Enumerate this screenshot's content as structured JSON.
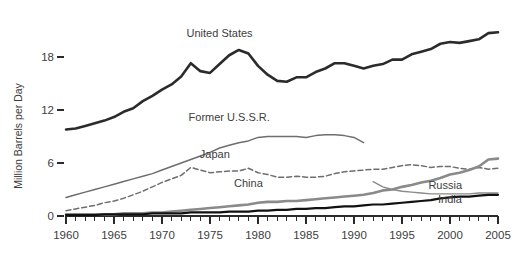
{
  "chart_data": {
    "type": "line",
    "title": "",
    "xlabel": "",
    "ylabel": "Million Barrels per Day",
    "xlim": [
      1960,
      2005
    ],
    "ylim": [
      0,
      20.8
    ],
    "yticks": [
      0,
      6,
      12,
      18
    ],
    "ytick_labels": [
      "0",
      "6",
      "12",
      "18"
    ],
    "xticks": [
      1960,
      1965,
      1970,
      1975,
      1980,
      1985,
      1990,
      1995,
      2000,
      2005
    ],
    "xtick_labels": [
      "1960",
      "1965",
      "1970",
      "1975",
      "1980",
      "1985",
      "1990",
      "1995",
      "2000",
      "2005"
    ],
    "x_minor_tick_step": 1,
    "grid": false,
    "legend": "inline-labels",
    "series": [
      {
        "name": "United States",
        "label": "United States",
        "color": "#2b2b2b",
        "width": 2.6,
        "dash": "",
        "label_x": 1976.0,
        "label_y": 20.3,
        "x": [
          1960,
          1961,
          1962,
          1963,
          1964,
          1965,
          1966,
          1967,
          1968,
          1969,
          1970,
          1971,
          1972,
          1973,
          1974,
          1975,
          1976,
          1977,
          1978,
          1979,
          1980,
          1981,
          1982,
          1983,
          1984,
          1985,
          1986,
          1987,
          1988,
          1989,
          1990,
          1991,
          1992,
          1993,
          1994,
          1995,
          1996,
          1997,
          1998,
          1999,
          2000,
          2001,
          2002,
          2003,
          2004,
          2005
        ],
        "y": [
          9.8,
          9.9,
          10.2,
          10.5,
          10.8,
          11.2,
          11.8,
          12.2,
          13.0,
          13.6,
          14.3,
          14.9,
          15.8,
          17.3,
          16.4,
          16.2,
          17.2,
          18.2,
          18.8,
          18.4,
          17.0,
          16.0,
          15.3,
          15.2,
          15.7,
          15.7,
          16.3,
          16.7,
          17.3,
          17.3,
          17.0,
          16.7,
          17.0,
          17.2,
          17.7,
          17.7,
          18.3,
          18.6,
          18.9,
          19.5,
          19.7,
          19.6,
          19.8,
          20.0,
          20.7,
          20.8
        ]
      },
      {
        "name": "Former U.S.S.R.",
        "label": "Former U.S.S.R.",
        "color": "#6e6e6e",
        "width": 1.5,
        "dash": "",
        "label_x": 1977.0,
        "label_y": 10.7,
        "x": [
          1960,
          1961,
          1962,
          1963,
          1964,
          1965,
          1966,
          1967,
          1968,
          1969,
          1970,
          1971,
          1972,
          1973,
          1974,
          1975,
          1976,
          1977,
          1978,
          1979,
          1980,
          1981,
          1982,
          1983,
          1984,
          1985,
          1986,
          1987,
          1988,
          1989,
          1990,
          1991
        ],
        "y": [
          2.1,
          2.4,
          2.7,
          3.0,
          3.3,
          3.6,
          3.9,
          4.2,
          4.5,
          4.8,
          5.2,
          5.6,
          6.0,
          6.4,
          6.8,
          7.2,
          7.7,
          8.0,
          8.3,
          8.5,
          8.9,
          9.0,
          9.0,
          9.0,
          9.0,
          8.9,
          9.1,
          9.2,
          9.2,
          9.1,
          8.9,
          8.3
        ]
      },
      {
        "name": "Japan",
        "label": "Japan",
        "color": "#6e6e6e",
        "width": 1.5,
        "dash": "5,3",
        "label_x": 1975.5,
        "label_y": 6.6,
        "x": [
          1960,
          1961,
          1962,
          1963,
          1964,
          1965,
          1966,
          1967,
          1968,
          1969,
          1970,
          1971,
          1972,
          1973,
          1974,
          1975,
          1976,
          1977,
          1978,
          1979,
          1980,
          1981,
          1982,
          1983,
          1984,
          1985,
          1986,
          1987,
          1988,
          1989,
          1990,
          1991,
          1992,
          1993,
          1994,
          1995,
          1996,
          1997,
          1998,
          1999,
          2000,
          2001,
          2002,
          2003,
          2004,
          2005
        ],
        "y": [
          0.6,
          0.8,
          1.0,
          1.2,
          1.5,
          1.7,
          2.0,
          2.4,
          2.8,
          3.3,
          3.8,
          4.2,
          4.6,
          5.5,
          5.2,
          4.9,
          5.0,
          5.1,
          5.1,
          5.4,
          4.9,
          4.7,
          4.4,
          4.4,
          4.5,
          4.4,
          4.4,
          4.5,
          4.8,
          5.0,
          5.1,
          5.2,
          5.3,
          5.3,
          5.5,
          5.7,
          5.8,
          5.7,
          5.5,
          5.6,
          5.6,
          5.4,
          5.3,
          5.5,
          5.3,
          5.4
        ]
      },
      {
        "name": "China",
        "label": "China",
        "color": "#8a8a8a",
        "width": 2.6,
        "dash": "",
        "label_x": 1979.0,
        "label_y": 3.3,
        "x": [
          1960,
          1961,
          1962,
          1963,
          1964,
          1965,
          1966,
          1967,
          1968,
          1969,
          1970,
          1971,
          1972,
          1973,
          1974,
          1975,
          1976,
          1977,
          1978,
          1979,
          1980,
          1981,
          1982,
          1983,
          1984,
          1985,
          1986,
          1987,
          1988,
          1989,
          1990,
          1991,
          1992,
          1993,
          1994,
          1995,
          1996,
          1997,
          1998,
          1999,
          2000,
          2001,
          2002,
          2003,
          2004,
          2005
        ],
        "y": [
          0.2,
          0.2,
          0.2,
          0.2,
          0.2,
          0.2,
          0.3,
          0.3,
          0.3,
          0.4,
          0.4,
          0.5,
          0.6,
          0.7,
          0.8,
          0.9,
          1.0,
          1.1,
          1.2,
          1.3,
          1.5,
          1.6,
          1.6,
          1.7,
          1.7,
          1.8,
          1.9,
          2.0,
          2.1,
          2.2,
          2.3,
          2.4,
          2.6,
          2.9,
          3.0,
          3.3,
          3.5,
          3.8,
          4.0,
          4.3,
          4.7,
          4.9,
          5.2,
          5.6,
          6.4,
          6.5
        ]
      },
      {
        "name": "Russia",
        "label": "Russia",
        "color": "#8a8a8a",
        "width": 1.4,
        "dash": "",
        "label_x": 1999.5,
        "label_y": 3.1,
        "x": [
          1992,
          1993,
          1994,
          1995,
          1996,
          1997,
          1998,
          1999,
          2000,
          2001,
          2002,
          2003,
          2004,
          2005
        ],
        "y": [
          3.9,
          3.3,
          3.0,
          2.8,
          2.7,
          2.6,
          2.5,
          2.5,
          2.5,
          2.5,
          2.5,
          2.6,
          2.6,
          2.6
        ]
      },
      {
        "name": "India",
        "label": "India",
        "color": "#111111",
        "width": 2.2,
        "dash": "",
        "label_x": 2000.0,
        "label_y": 1.45,
        "x": [
          1960,
          1961,
          1962,
          1963,
          1964,
          1965,
          1966,
          1967,
          1968,
          1969,
          1970,
          1971,
          1972,
          1973,
          1974,
          1975,
          1976,
          1977,
          1978,
          1979,
          1980,
          1981,
          1982,
          1983,
          1984,
          1985,
          1986,
          1987,
          1988,
          1989,
          1990,
          1991,
          1992,
          1993,
          1994,
          1995,
          1996,
          1997,
          1998,
          1999,
          2000,
          2001,
          2002,
          2003,
          2004,
          2005
        ],
        "y": [
          0.1,
          0.1,
          0.1,
          0.1,
          0.2,
          0.2,
          0.2,
          0.2,
          0.2,
          0.3,
          0.3,
          0.3,
          0.3,
          0.4,
          0.4,
          0.4,
          0.4,
          0.5,
          0.5,
          0.5,
          0.6,
          0.6,
          0.7,
          0.7,
          0.8,
          0.8,
          0.9,
          0.9,
          1.0,
          1.1,
          1.1,
          1.2,
          1.3,
          1.3,
          1.4,
          1.5,
          1.6,
          1.7,
          1.8,
          2.0,
          2.1,
          2.2,
          2.2,
          2.3,
          2.4,
          2.4
        ]
      }
    ]
  }
}
